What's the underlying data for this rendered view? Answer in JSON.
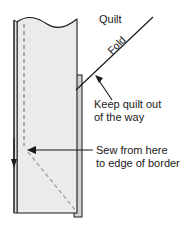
{
  "diagram": {
    "background_color": "#ffffff",
    "labels": {
      "quilt": "Quilt",
      "fold": "Fold",
      "keep_quilt_line1": "Keep quilt out",
      "keep_quilt_line2": "of the way",
      "sew_line1": "Sew from here",
      "sew_line2": "to edge of border"
    },
    "colors": {
      "outline": "#1a1a1a",
      "fabric_fill": "#ebebeb",
      "border_strip_fill": "#d2d2d2",
      "left_strip_fill": "#e2e2e2",
      "stitch_dash": "#808080",
      "text": "#1a1a1a",
      "leader_line": "#1a1a1a"
    },
    "shapes": {
      "main_panel_label": "quilt-border-panel",
      "wavy_top_label": "torn-fabric-edge",
      "right_strip_label": "border-strip",
      "left_strip_label": "folded-edge-strip",
      "vertical_stitch_label": "vertical-stitch-line",
      "diagonal_stitch_label": "miter-stitch-line",
      "fold_line_label": "fold-line"
    }
  }
}
